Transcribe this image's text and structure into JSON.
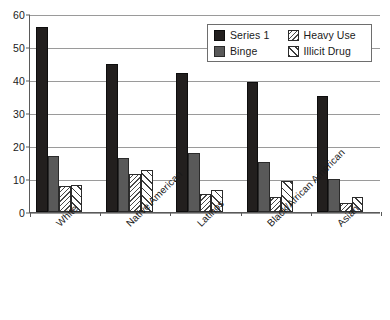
{
  "chart_data": {
    "type": "bar",
    "title": "",
    "subtitle": "",
    "xlabel": "",
    "ylabel": "",
    "ylim": [
      0,
      60
    ],
    "yticks": [
      0,
      10,
      20,
      30,
      40,
      50,
      60
    ],
    "ytick_labels": [
      "0",
      "10",
      "20",
      "30",
      "40",
      "50",
      "60"
    ],
    "grid": true,
    "grid_axis": "y",
    "legend_position": "top-right",
    "categories": [
      "White",
      "Native American",
      "Latinos",
      "Black/African American",
      "Asian"
    ],
    "series": [
      {
        "name": "Series 1",
        "color": "#221f1e",
        "pattern": "solid",
        "values": [
          56.2,
          44.9,
          42.2,
          39.5,
          35.3
        ]
      },
      {
        "name": "Binge",
        "color": "#595959",
        "pattern": "solid",
        "values": [
          17.0,
          16.5,
          18.0,
          15.1,
          10.1
        ]
      },
      {
        "name": "Heavy Use",
        "color": "#4a4a4a",
        "pattern": "backward-diagonal-hatch",
        "values": [
          7.9,
          11.6,
          5.6,
          4.4,
          2.6
        ]
      },
      {
        "name": "Illicit Drug",
        "color": "#3d3d3d",
        "pattern": "forward-diagonal-hatch",
        "values": [
          8.2,
          12.6,
          6.7,
          9.5,
          4.4
        ]
      }
    ]
  },
  "legend": {
    "entries": [
      {
        "label": "Series 1",
        "swatch": "series1-swatch-icon"
      },
      {
        "label": "Heavy Use",
        "swatch": "heavy-use-swatch-icon"
      },
      {
        "label": "Binge",
        "swatch": "binge-swatch-icon"
      },
      {
        "label": "Illicit Drug",
        "swatch": "illicit-drug-swatch-icon"
      }
    ]
  },
  "colors": {
    "series1": "#221f1e",
    "binge": "#595959",
    "heavy_use": "#4a4a4a",
    "illicit_drug": "#3d3d3d",
    "gridline": "#9a9a9a",
    "axis": "#5a5a5a",
    "background": "#ffffff"
  }
}
